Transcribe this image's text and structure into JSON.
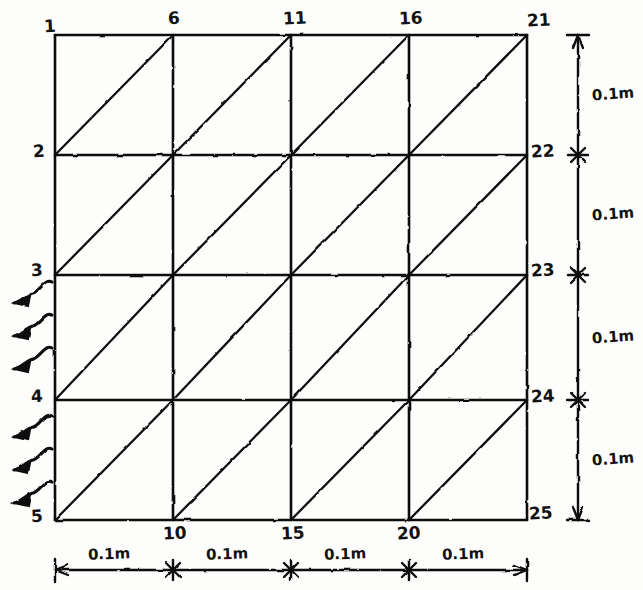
{
  "figure": {
    "type": "hand-drawn-engineering-sketch",
    "ink_color": "#111111",
    "paper_color": "#fdfdfb"
  },
  "mesh": {
    "columns": 5,
    "rows": 5,
    "cells_x": 4,
    "cells_y": 4,
    "diagonal_direction": "bottom-left-to-top-right",
    "grid_left": 55,
    "grid_right": 527,
    "grid_top": 35,
    "grid_bottom": 520,
    "col_x": [
      55,
      173,
      291,
      409,
      527
    ],
    "row_y": [
      35,
      155,
      275,
      400,
      520
    ]
  },
  "nodes": {
    "left_column": [
      {
        "id": "1",
        "x": 44,
        "y": 18
      },
      {
        "id": "2",
        "x": 33,
        "y": 143
      },
      {
        "id": "3",
        "x": 31,
        "y": 262
      },
      {
        "id": "4",
        "x": 31,
        "y": 388
      },
      {
        "id": "5",
        "x": 31,
        "y": 508
      }
    ],
    "top_row": [
      {
        "id": "6",
        "x": 168,
        "y": 10
      },
      {
        "id": "11",
        "x": 283,
        "y": 10
      },
      {
        "id": "16",
        "x": 399,
        "y": 10
      },
      {
        "id": "21",
        "x": 527,
        "y": 12
      }
    ],
    "right_column": [
      {
        "id": "22",
        "x": 531,
        "y": 143
      },
      {
        "id": "23",
        "x": 531,
        "y": 262
      },
      {
        "id": "24",
        "x": 531,
        "y": 388
      },
      {
        "id": "25",
        "x": 529,
        "y": 505
      }
    ],
    "bottom_row": [
      {
        "id": "10",
        "x": 163,
        "y": 525
      },
      {
        "id": "15",
        "x": 281,
        "y": 525
      },
      {
        "id": "20",
        "x": 397,
        "y": 525
      }
    ]
  },
  "dimensions": {
    "horizontal": {
      "axis_y": 570,
      "label_y": 547,
      "segments": [
        {
          "label": "0.1m",
          "from": 55,
          "to": 173
        },
        {
          "label": "0.1m",
          "from": 173,
          "to": 291
        },
        {
          "label": "0.1m",
          "from": 291,
          "to": 409
        },
        {
          "label": "0.1m",
          "from": 409,
          "to": 527
        }
      ]
    },
    "vertical": {
      "axis_x": 578,
      "label_x": 592,
      "segments": [
        {
          "label": "0.1m",
          "from": 35,
          "to": 155
        },
        {
          "label": "0.1m",
          "from": 155,
          "to": 275
        },
        {
          "label": "0.1m",
          "from": 275,
          "to": 400
        },
        {
          "label": "0.1m",
          "from": 400,
          "to": 520
        }
      ]
    }
  },
  "load_arrows": {
    "description": "wavy arrows pointing left along the left edge between node 3 and node 5",
    "count": 6,
    "direction": "left",
    "tip_x": 14,
    "tail_x": 52,
    "y_positions": [
      294,
      327,
      360,
      428,
      461,
      494
    ]
  }
}
